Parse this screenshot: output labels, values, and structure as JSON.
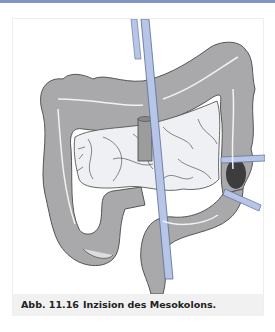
{
  "figure": {
    "label": "Abb. 11.16",
    "caption": "Inzision des Mesokolons.",
    "illustration": {
      "subject": "colon-with-mesocolon-incision",
      "colors": {
        "colon": "#a9a9ab",
        "colon_outline": "#555555",
        "small_bowel": "#eef0f4",
        "vessel": "#b7c6e6",
        "vessel_outline": "#5a6a99",
        "tumor": "#1a1a1a",
        "topbar": "#7f95c8",
        "caption_bg": "#f1f1f1"
      }
    }
  }
}
